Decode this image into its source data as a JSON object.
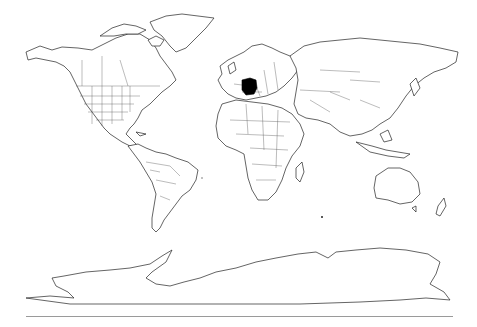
{
  "map": {
    "type": "world-outline",
    "projection": "cylindrical (Miller-like)",
    "highlighted_country": "Germany",
    "highlight_color": "#000000",
    "land_fill": "#ffffff",
    "outline_color": "#222222",
    "background": "#ffffff",
    "baseline_color": "#9a9a9a"
  }
}
